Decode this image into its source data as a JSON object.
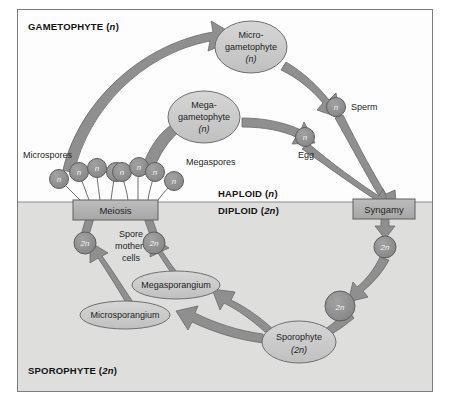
{
  "diagram": {
    "type": "biology-life-cycle",
    "zones": [
      {
        "id": "gametophyte",
        "label": "GAMETOPHYTE (n)",
        "label_plain": "GAMETOPHYTE",
        "ploidy": "n",
        "background": "#fdfdfd"
      },
      {
        "id": "sporophyte",
        "label": "SPOROPHYTE (2n)",
        "label_plain": "SPOROPHYTE",
        "ploidy": "2n",
        "background": "#dededd"
      }
    ],
    "divider_labels": [
      {
        "id": "haploid",
        "label": "HAPLOID (n)",
        "label_plain": "HAPLOID",
        "ploidy": "n"
      },
      {
        "id": "diploid",
        "label": "DIPLOID (2n)",
        "label_plain": "DIPLOID",
        "ploidy": "2n"
      }
    ],
    "process_boxes": [
      {
        "id": "meiosis",
        "label": "Meiosis"
      },
      {
        "id": "syngamy",
        "label": "Syngamy"
      }
    ],
    "ellipses": [
      {
        "id": "microgametophyte",
        "line1": "Micro-",
        "line2": "gametophyte",
        "line3": "(n)"
      },
      {
        "id": "megagametophyte",
        "line1": "Mega-",
        "line2": "gametophyte",
        "line3": "(n)"
      },
      {
        "id": "megasporangium",
        "line1": "Megasporangium"
      },
      {
        "id": "microsporangium",
        "line1": "Microsporangium"
      },
      {
        "id": "sporophyte",
        "line1": "Sporophyte",
        "line2": "(2n)"
      }
    ],
    "cell_circles": [
      {
        "id": "microspore-1",
        "label": "n"
      },
      {
        "id": "microspore-2",
        "label": "n"
      },
      {
        "id": "microspore-3",
        "label": "n"
      },
      {
        "id": "microspore-4",
        "label": "n"
      },
      {
        "id": "megaspore-1",
        "label": "n"
      },
      {
        "id": "megaspore-2",
        "label": "n"
      },
      {
        "id": "megaspore-3",
        "label": "n"
      },
      {
        "id": "megaspore-4",
        "label": "n"
      },
      {
        "id": "sperm",
        "label": "n"
      },
      {
        "id": "egg",
        "label": "n"
      },
      {
        "id": "zygote",
        "label": "2n"
      },
      {
        "id": "embryo",
        "label": "2n"
      },
      {
        "id": "spore-mother-cell-left",
        "label": "2n"
      },
      {
        "id": "spore-mother-cell-right",
        "label": "2n"
      }
    ],
    "text_labels": [
      {
        "id": "microspores",
        "label": "Microspores"
      },
      {
        "id": "megaspores",
        "label": "Megaspores"
      },
      {
        "id": "sperm",
        "label": "Sperm"
      },
      {
        "id": "egg",
        "label": "Egg"
      },
      {
        "id": "spore-mother-cells-l1",
        "label": "Spore"
      },
      {
        "id": "spore-mother-cells-l2",
        "label": "mother"
      },
      {
        "id": "spore-mother-cells-l3",
        "label": "cells"
      }
    ],
    "colors": {
      "arrow": "#8a8a8a",
      "arrow_stroke": "#5e5e5e",
      "ellipse_fill": "#c9c9c9",
      "ellipse_stroke": "#6f6f6f",
      "box_fill": "#b3b3b3",
      "box_stroke": "#5e5e5e",
      "circle_fill": "#8f8f8f",
      "circle_stroke": "#5e5e5e",
      "diploid_bg": "#dededd",
      "haploid_bg": "#fdfdfd",
      "frame_stroke": "#7d7d7d"
    }
  }
}
